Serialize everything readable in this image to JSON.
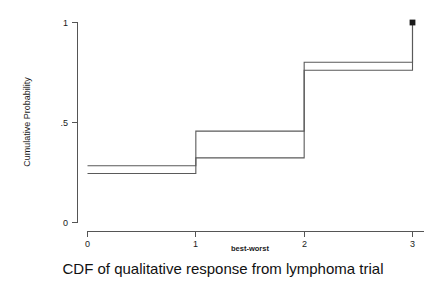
{
  "chart_data": {
    "type": "line",
    "title": "",
    "caption": "CDF of qualitative response from lymphoma trial",
    "xlabel": "best-worst",
    "ylabel": "Cumulative Probability",
    "xlim": [
      0,
      3
    ],
    "ylim": [
      0,
      1
    ],
    "xticks": [
      0,
      1,
      2,
      3
    ],
    "xticklabels": [
      "0",
      "1",
      "2",
      "3"
    ],
    "yticks": [
      0,
      0.5,
      1
    ],
    "yticklabels": [
      "0",
      ".5",
      "1"
    ],
    "grid": false,
    "legend": false,
    "step_style": "post",
    "x": [
      0,
      1,
      2,
      3
    ],
    "series": [
      {
        "name": "curve-upper",
        "values": [
          0.284,
          0.457,
          0.801,
          1.0
        ]
      },
      {
        "name": "curve-lower",
        "values": [
          0.245,
          0.323,
          0.761,
          1.0
        ]
      }
    ],
    "end_marker": {
      "x": 3,
      "y": 1.0,
      "shape": "square"
    },
    "colors": {
      "curve": "#5a5a5a",
      "axis": "#555555",
      "marker": "#1a1a1a",
      "background": "#ffffff"
    }
  }
}
